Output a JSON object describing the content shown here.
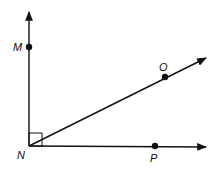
{
  "diagram": {
    "type": "geometry-angles",
    "vertex": {
      "label": "N",
      "x": 29,
      "y": 146
    },
    "points": [
      {
        "label": "M",
        "x": 29,
        "y": 47
      },
      {
        "label": "O",
        "x": 165,
        "y": 77
      },
      {
        "label": "P",
        "x": 155,
        "y": 146
      }
    ],
    "rays": [
      "NM",
      "NO",
      "NP"
    ],
    "right_angle_marker": "MNP",
    "colors": {
      "stroke": "#111111",
      "background": "#ffffff"
    }
  }
}
